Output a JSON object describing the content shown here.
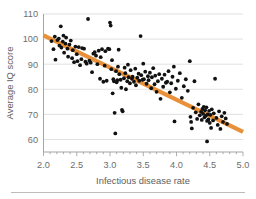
{
  "figure": {
    "background_color": "#ffffff",
    "footer_rule_color": "#b4b4b4"
  },
  "chart_data": {
    "type": "scatter",
    "title": "",
    "subtitle": "",
    "xlabel": "Infectious disease rate",
    "ylabel": "Average IQ score",
    "xlim": [
      2.0,
      5.0
    ],
    "ylim": [
      55,
      110
    ],
    "grid": "horizontal",
    "legend": "none",
    "point_color": "#111111",
    "point_radius_px": 1.9,
    "xticks": [
      2.0,
      2.5,
      3.0,
      3.5,
      4.0,
      4.5,
      5.0
    ],
    "xtick_labels": [
      "2.0",
      "2.5",
      "3.0",
      "3.5",
      "4.0",
      "4.5",
      "5.0"
    ],
    "xtick_minor_step": 0.1,
    "yticks": [
      60,
      70,
      80,
      90,
      100,
      110
    ],
    "ytick_labels": [
      "60",
      "70",
      "80",
      "90",
      "100",
      "110"
    ],
    "trend_line": {
      "color": "#e8913a",
      "width_px": 4.2,
      "x_start": 2.0,
      "y_start": 101.5,
      "x_end": 5.0,
      "y_end": 63.0,
      "slope": -12.83,
      "intercept": 127.17
    },
    "series": [
      {
        "name": "Nations",
        "color": "#111111",
        "points": [
          [
            2.12,
            99.2
          ],
          [
            2.15,
            96.0
          ],
          [
            2.17,
            101.0
          ],
          [
            2.18,
            91.8
          ],
          [
            2.21,
            99.6
          ],
          [
            2.23,
            100.2
          ],
          [
            2.24,
            97.4
          ],
          [
            2.26,
            105.1
          ],
          [
            2.27,
            96.6
          ],
          [
            2.29,
            99.0
          ],
          [
            2.3,
            101.4
          ],
          [
            2.31,
            94.6
          ],
          [
            2.33,
            98.2
          ],
          [
            2.34,
            100.6
          ],
          [
            2.36,
            96.2
          ],
          [
            2.37,
            93.0
          ],
          [
            2.39,
            97.8
          ],
          [
            2.41,
            99.4
          ],
          [
            2.43,
            92.4
          ],
          [
            2.44,
            95.6
          ],
          [
            2.46,
            90.8
          ],
          [
            2.48,
            97.0
          ],
          [
            2.5,
            94.0
          ],
          [
            2.51,
            91.2
          ],
          [
            2.53,
            96.8
          ],
          [
            2.55,
            89.6
          ],
          [
            2.57,
            92.0
          ],
          [
            2.58,
            96.4
          ],
          [
            2.61,
            96.2
          ],
          [
            2.63,
            91.0
          ],
          [
            2.65,
            90.2
          ],
          [
            2.67,
            108.0
          ],
          [
            2.69,
            91.4
          ],
          [
            2.71,
            90.6
          ],
          [
            2.73,
            86.8
          ],
          [
            2.75,
            94.2
          ],
          [
            2.77,
            94.8
          ],
          [
            2.79,
            93.4
          ],
          [
            2.81,
            90.0
          ],
          [
            2.83,
            95.4
          ],
          [
            2.85,
            84.2
          ],
          [
            2.86,
            92.8
          ],
          [
            2.88,
            96.0
          ],
          [
            2.9,
            83.0
          ],
          [
            2.92,
            89.4
          ],
          [
            2.93,
            95.2
          ],
          [
            2.95,
            83.4
          ],
          [
            2.97,
            96.2
          ],
          [
            2.99,
            96.0
          ],
          [
            3.0,
            106.6
          ],
          [
            3.01,
            105.4
          ],
          [
            3.02,
            88.0
          ],
          [
            3.03,
            91.6
          ],
          [
            3.04,
            78.4
          ],
          [
            3.05,
            84.0
          ],
          [
            3.06,
            83.2
          ],
          [
            3.07,
            70.6
          ],
          [
            3.08,
            62.4
          ],
          [
            3.09,
            87.2
          ],
          [
            3.1,
            82.8
          ],
          [
            3.11,
            83.6
          ],
          [
            3.12,
            89.0
          ],
          [
            3.13,
            95.8
          ],
          [
            3.14,
            86.0
          ],
          [
            3.16,
            83.8
          ],
          [
            3.17,
            80.6
          ],
          [
            3.18,
            71.8
          ],
          [
            3.19,
            71.2
          ],
          [
            3.21,
            84.4
          ],
          [
            3.22,
            88.6
          ],
          [
            3.23,
            86.4
          ],
          [
            3.24,
            80.0
          ],
          [
            3.26,
            83.2
          ],
          [
            3.27,
            89.8
          ],
          [
            3.28,
            84.8
          ],
          [
            3.3,
            82.4
          ],
          [
            3.31,
            87.6
          ],
          [
            3.33,
            84.2
          ],
          [
            3.34,
            85.0
          ],
          [
            3.36,
            83.0
          ],
          [
            3.38,
            88.2
          ],
          [
            3.39,
            81.6
          ],
          [
            3.41,
            84.6
          ],
          [
            3.43,
            86.2
          ],
          [
            3.44,
            83.4
          ],
          [
            3.46,
            101.2
          ],
          [
            3.47,
            85.6
          ],
          [
            3.49,
            83.8
          ],
          [
            3.5,
            90.2
          ],
          [
            3.51,
            84.0
          ],
          [
            3.53,
            87.0
          ],
          [
            3.55,
            82.2
          ],
          [
            3.57,
            85.2
          ],
          [
            3.58,
            83.6
          ],
          [
            3.6,
            86.6
          ],
          [
            3.62,
            80.4
          ],
          [
            3.63,
            84.8
          ],
          [
            3.65,
            88.4
          ],
          [
            3.67,
            82.0
          ],
          [
            3.68,
            85.4
          ],
          [
            3.7,
            79.0
          ],
          [
            3.72,
            83.2
          ],
          [
            3.74,
            86.0
          ],
          [
            3.76,
            76.2
          ],
          [
            3.78,
            84.2
          ],
          [
            3.8,
            81.0
          ],
          [
            3.82,
            85.8
          ],
          [
            3.84,
            82.6
          ],
          [
            3.86,
            83.0
          ],
          [
            3.88,
            87.2
          ],
          [
            3.9,
            78.8
          ],
          [
            3.92,
            82.4
          ],
          [
            3.94,
            85.0
          ],
          [
            3.96,
            89.0
          ],
          [
            3.97,
            67.2
          ],
          [
            3.99,
            80.2
          ],
          [
            4.02,
            83.4
          ],
          [
            4.05,
            86.4
          ],
          [
            4.08,
            76.6
          ],
          [
            4.11,
            81.2
          ],
          [
            4.14,
            84.0
          ],
          [
            4.17,
            79.4
          ],
          [
            4.2,
            91.2
          ],
          [
            4.21,
            69.0
          ],
          [
            4.22,
            67.0
          ],
          [
            4.23,
            64.4
          ],
          [
            4.25,
            72.6
          ],
          [
            4.27,
            83.2
          ],
          [
            4.29,
            70.8
          ],
          [
            4.31,
            68.2
          ],
          [
            4.33,
            74.0
          ],
          [
            4.35,
            69.6
          ],
          [
            4.37,
            71.0
          ],
          [
            4.38,
            67.8
          ],
          [
            4.39,
            72.2
          ],
          [
            4.4,
            70.2
          ],
          [
            4.41,
            73.0
          ],
          [
            4.42,
            68.8
          ],
          [
            4.43,
            71.6
          ],
          [
            4.44,
            69.4
          ],
          [
            4.45,
            72.8
          ],
          [
            4.46,
            59.2
          ],
          [
            4.46,
            67.4
          ],
          [
            4.47,
            70.0
          ],
          [
            4.48,
            68.0
          ],
          [
            4.49,
            71.4
          ],
          [
            4.5,
            66.6
          ],
          [
            4.51,
            69.8
          ],
          [
            4.52,
            64.6
          ],
          [
            4.53,
            72.0
          ],
          [
            4.55,
            67.6
          ],
          [
            4.56,
            70.4
          ],
          [
            4.58,
            84.2
          ],
          [
            4.6,
            68.6
          ],
          [
            4.62,
            65.8
          ],
          [
            4.64,
            71.2
          ],
          [
            4.66,
            64.2
          ],
          [
            4.68,
            69.2
          ],
          [
            4.7,
            67.0
          ],
          [
            4.72,
            70.6
          ],
          [
            4.74,
            68.4
          ],
          [
            4.76,
            66.2
          ]
        ]
      }
    ]
  }
}
